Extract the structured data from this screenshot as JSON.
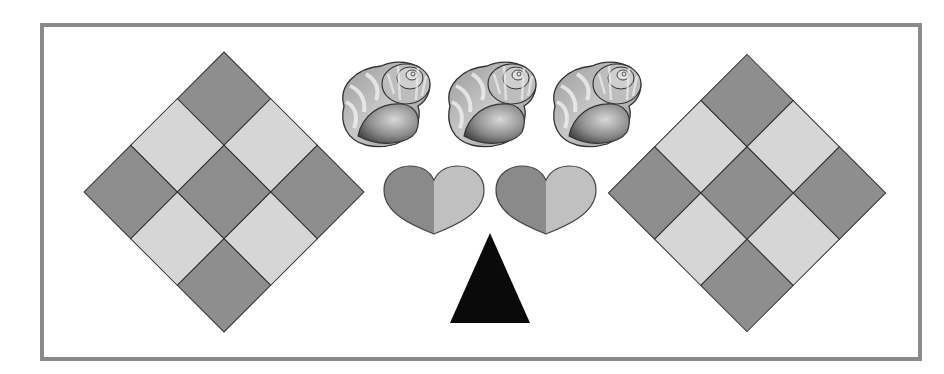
{
  "puzzle": {
    "colors": {
      "frame": "#8a8a8a",
      "tile_dark": "#8e8e8e",
      "tile_light": "#d6d6d6",
      "heart_dark": "#8a8a8a",
      "heart_light": "#c0c0c0",
      "triangle": "#0a0a0a",
      "outline": "#333333"
    },
    "left_diamond": {
      "center": [
        224,
        192
      ],
      "half_diagonal": 140,
      "grid": 3,
      "pattern": [
        "dark",
        "light",
        "dark",
        "light",
        "dark",
        "light",
        "dark",
        "light",
        "dark"
      ]
    },
    "right_diamond": {
      "center": [
        747,
        193
      ],
      "half_diagonal": 138,
      "grid": 3,
      "pattern": [
        "dark",
        "light",
        "dark",
        "light",
        "dark",
        "light",
        "dark",
        "light",
        "dark"
      ]
    },
    "shells": [
      {
        "name": "shell-1",
        "x": 336,
        "y": 56
      },
      {
        "name": "shell-2",
        "x": 442,
        "y": 56
      },
      {
        "name": "shell-3",
        "x": 547,
        "y": 56
      }
    ],
    "hearts": [
      {
        "name": "heart-1",
        "x": 384,
        "y": 166
      },
      {
        "name": "heart-2",
        "x": 496,
        "y": 166
      }
    ],
    "triangle": {
      "apex": [
        490,
        233
      ],
      "base_left": [
        450,
        323
      ],
      "base_right": [
        530,
        323
      ]
    }
  }
}
